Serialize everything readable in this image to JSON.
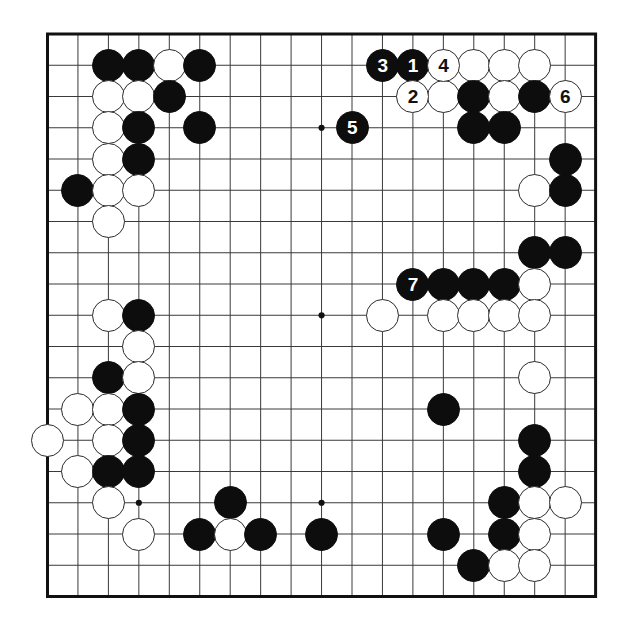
{
  "diagram": {
    "kind": "go-board-diagram",
    "board_size": 19,
    "geometry": {
      "origin_x": 47.5,
      "origin_y": 34.0,
      "step_x": 30.45,
      "step_y": 31.25,
      "stone_radius": 16.5,
      "border_width": 3.0,
      "line_width": 1.0
    },
    "colors": {
      "background": "#ffffff",
      "line": "#3a3a3a",
      "border": "#111111",
      "black_stone": "#0d0d0d",
      "white_stone": "#ffffff",
      "white_stone_outline": "#2b2b2b",
      "black_label": "#ffffff",
      "white_label": "#111111"
    },
    "star_points": [
      {
        "col": 3,
        "row": 3
      },
      {
        "col": 9,
        "row": 3
      },
      {
        "col": 15,
        "row": 3
      },
      {
        "col": 3,
        "row": 9
      },
      {
        "col": 9,
        "row": 9
      },
      {
        "col": 15,
        "row": 9
      },
      {
        "col": 3,
        "row": 15
      },
      {
        "col": 9,
        "row": 15
      },
      {
        "col": 15,
        "row": 15
      }
    ],
    "numbered_moves": [
      {
        "col": 12,
        "row": 1,
        "color": "black",
        "label": "1"
      },
      {
        "col": 12,
        "row": 2,
        "color": "white",
        "label": "2"
      },
      {
        "col": 11,
        "row": 1,
        "color": "black",
        "label": "3"
      },
      {
        "col": 13,
        "row": 1,
        "color": "white",
        "label": "4"
      },
      {
        "col": 10,
        "row": 3,
        "color": "black",
        "label": "5"
      },
      {
        "col": 17,
        "row": 2,
        "color": "white",
        "label": "6"
      },
      {
        "col": 12,
        "row": 8,
        "color": "black",
        "label": "7"
      }
    ],
    "stones": [
      {
        "col": 2,
        "row": 1,
        "color": "black"
      },
      {
        "col": 3,
        "row": 1,
        "color": "black"
      },
      {
        "col": 4,
        "row": 1,
        "color": "white"
      },
      {
        "col": 5,
        "row": 1,
        "color": "black"
      },
      {
        "col": 14,
        "row": 1,
        "color": "white"
      },
      {
        "col": 15,
        "row": 1,
        "color": "white"
      },
      {
        "col": 16,
        "row": 1,
        "color": "white"
      },
      {
        "col": 2,
        "row": 2,
        "color": "white"
      },
      {
        "col": 3,
        "row": 2,
        "color": "white"
      },
      {
        "col": 4,
        "row": 2,
        "color": "black"
      },
      {
        "col": 13,
        "row": 2,
        "color": "white"
      },
      {
        "col": 14,
        "row": 2,
        "color": "black"
      },
      {
        "col": 15,
        "row": 2,
        "color": "white"
      },
      {
        "col": 16,
        "row": 2,
        "color": "black"
      },
      {
        "col": 2,
        "row": 3,
        "color": "white"
      },
      {
        "col": 3,
        "row": 3,
        "color": "black"
      },
      {
        "col": 5,
        "row": 3,
        "color": "black"
      },
      {
        "col": 14,
        "row": 3,
        "color": "black"
      },
      {
        "col": 15,
        "row": 3,
        "color": "black"
      },
      {
        "col": 2,
        "row": 4,
        "color": "white"
      },
      {
        "col": 3,
        "row": 4,
        "color": "black"
      },
      {
        "col": 17,
        "row": 4,
        "color": "black"
      },
      {
        "col": 1,
        "row": 5,
        "color": "black"
      },
      {
        "col": 2,
        "row": 5,
        "color": "white"
      },
      {
        "col": 3,
        "row": 5,
        "color": "white"
      },
      {
        "col": 16,
        "row": 5,
        "color": "white"
      },
      {
        "col": 17,
        "row": 5,
        "color": "black"
      },
      {
        "col": 2,
        "row": 6,
        "color": "white"
      },
      {
        "col": 16,
        "row": 7,
        "color": "black"
      },
      {
        "col": 17,
        "row": 7,
        "color": "black"
      },
      {
        "col": 13,
        "row": 8,
        "color": "black"
      },
      {
        "col": 14,
        "row": 8,
        "color": "black"
      },
      {
        "col": 15,
        "row": 8,
        "color": "black"
      },
      {
        "col": 16,
        "row": 8,
        "color": "white"
      },
      {
        "col": 2,
        "row": 9,
        "color": "white"
      },
      {
        "col": 3,
        "row": 9,
        "color": "black"
      },
      {
        "col": 11,
        "row": 9,
        "color": "white"
      },
      {
        "col": 13,
        "row": 9,
        "color": "white"
      },
      {
        "col": 14,
        "row": 9,
        "color": "white"
      },
      {
        "col": 15,
        "row": 9,
        "color": "white"
      },
      {
        "col": 16,
        "row": 9,
        "color": "white"
      },
      {
        "col": 3,
        "row": 10,
        "color": "white"
      },
      {
        "col": 2,
        "row": 11,
        "color": "black"
      },
      {
        "col": 3,
        "row": 11,
        "color": "white"
      },
      {
        "col": 16,
        "row": 11,
        "color": "white"
      },
      {
        "col": 1,
        "row": 12,
        "color": "white"
      },
      {
        "col": 2,
        "row": 12,
        "color": "white"
      },
      {
        "col": 3,
        "row": 12,
        "color": "black"
      },
      {
        "col": 13,
        "row": 12,
        "color": "black"
      },
      {
        "col": 0,
        "row": 13,
        "color": "white"
      },
      {
        "col": 2,
        "row": 13,
        "color": "white"
      },
      {
        "col": 3,
        "row": 13,
        "color": "black"
      },
      {
        "col": 16,
        "row": 13,
        "color": "black"
      },
      {
        "col": 1,
        "row": 14,
        "color": "white"
      },
      {
        "col": 2,
        "row": 14,
        "color": "black"
      },
      {
        "col": 3,
        "row": 14,
        "color": "black"
      },
      {
        "col": 16,
        "row": 14,
        "color": "black"
      },
      {
        "col": 2,
        "row": 15,
        "color": "white"
      },
      {
        "col": 6,
        "row": 15,
        "color": "black"
      },
      {
        "col": 15,
        "row": 15,
        "color": "black"
      },
      {
        "col": 16,
        "row": 15,
        "color": "white"
      },
      {
        "col": 17,
        "row": 15,
        "color": "white"
      },
      {
        "col": 3,
        "row": 16,
        "color": "white"
      },
      {
        "col": 5,
        "row": 16,
        "color": "black"
      },
      {
        "col": 6,
        "row": 16,
        "color": "white"
      },
      {
        "col": 7,
        "row": 16,
        "color": "black"
      },
      {
        "col": 9,
        "row": 16,
        "color": "black"
      },
      {
        "col": 13,
        "row": 16,
        "color": "black"
      },
      {
        "col": 15,
        "row": 16,
        "color": "black"
      },
      {
        "col": 16,
        "row": 16,
        "color": "white"
      },
      {
        "col": 14,
        "row": 17,
        "color": "black"
      },
      {
        "col": 15,
        "row": 17,
        "color": "white"
      },
      {
        "col": 16,
        "row": 17,
        "color": "white"
      }
    ]
  }
}
